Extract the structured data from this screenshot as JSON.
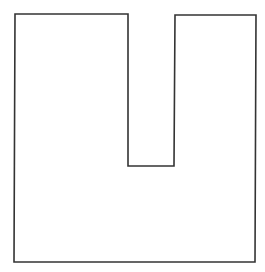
{
  "diagram": {
    "shape": "U-shaped polygon (square with rectangular notch cut from top)",
    "stroke_color": "#333333",
    "fill_color": "#ffffff",
    "background": "#ffffff",
    "stroke_width": 1.6,
    "points": [
      [
        15,
        14
      ],
      [
        128,
        14
      ],
      [
        128,
        166
      ],
      [
        174,
        166
      ],
      [
        175,
        15
      ],
      [
        256,
        15
      ],
      [
        255,
        262
      ],
      [
        14,
        262
      ]
    ]
  }
}
